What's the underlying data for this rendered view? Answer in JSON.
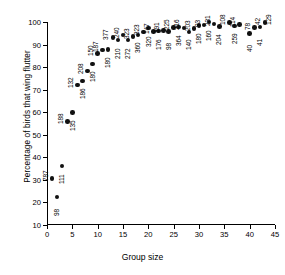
{
  "chart_data": {
    "type": "scatter",
    "title": "",
    "xlabel": "Group size",
    "ylabel": "Percentage of birds that wing flutter",
    "xlim": [
      0,
      45
    ],
    "ylim": [
      10,
      100
    ],
    "xticks": [
      0,
      5,
      10,
      15,
      20,
      25,
      30,
      35,
      40,
      45
    ],
    "yticks": [
      10,
      20,
      30,
      40,
      50,
      60,
      70,
      80,
      90,
      100
    ],
    "grid": false,
    "legend": null,
    "marker": "filled-circle",
    "point_label_orientation": "vertical",
    "point_label_meaning": "sample size (n) annotated beside each point",
    "x": [
      1,
      2,
      3,
      4,
      5,
      6,
      7,
      8,
      9,
      10,
      11,
      12,
      13,
      14,
      15,
      16,
      17,
      18,
      19,
      20,
      21,
      22,
      23,
      24,
      25,
      26,
      27,
      28,
      29,
      30,
      31,
      32,
      33,
      34,
      36,
      37,
      38,
      40,
      41,
      42,
      43
    ],
    "y": [
      30.5,
      22.4,
      36.2,
      56.0,
      59.9,
      72.0,
      73.9,
      78.2,
      81.4,
      86.1,
      87.6,
      87.7,
      93.2,
      92.0,
      94.2,
      92.0,
      93.6,
      94.3,
      95.5,
      97.3,
      95.8,
      96.0,
      96.2,
      95.9,
      97.6,
      97.7,
      97.4,
      95.6,
      97.1,
      98.4,
      98.7,
      100.0,
      99.2,
      98.1,
      99.7,
      98.3,
      98.8,
      95.0,
      97.6,
      97.7,
      99.8
    ],
    "labels": [
      "787",
      "98",
      "111",
      "188",
      "135",
      "132",
      "186",
      "208",
      "180",
      "150",
      "187",
      "180",
      "377",
      "210",
      "240",
      "272",
      "323",
      "360",
      "323",
      "320",
      "147",
      "176",
      "391",
      "98",
      "225",
      "364",
      "216",
      "140",
      "203",
      "180",
      "93",
      "160",
      "231",
      "204",
      "108",
      "259",
      "114",
      "40",
      "78",
      "41",
      "42"
    ],
    "label_side": [
      "left",
      "right",
      "right",
      "left",
      "right",
      "left",
      "right",
      "left",
      "right",
      "left",
      "left",
      "right",
      "left",
      "right",
      "left",
      "right",
      "left",
      "right",
      "left",
      "right",
      "left",
      "right",
      "left",
      "right",
      "left",
      "right",
      "left",
      "right",
      "left",
      "right",
      "left",
      "right",
      "left",
      "right",
      "left",
      "right",
      "left",
      "right",
      "left",
      "right",
      "left"
    ]
  },
  "extra_labels": [
    "129"
  ],
  "colors": {
    "marker": "#111111",
    "axis": "#000000",
    "background": "#ffffff"
  }
}
